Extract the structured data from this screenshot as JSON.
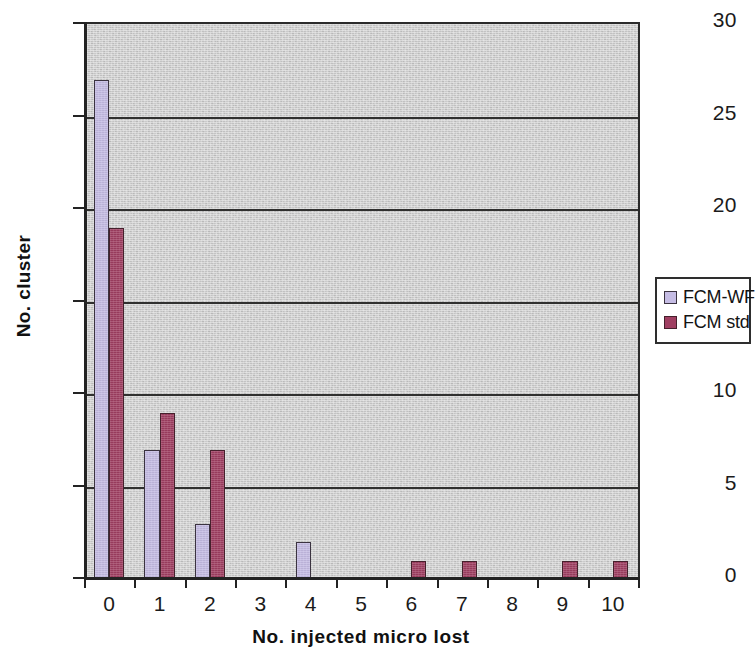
{
  "chart_data": {
    "type": "bar",
    "title": "",
    "subtitle": "",
    "xlabel": "No. injected  micro  lost",
    "ylabel": "No. cluster",
    "categories": [
      "0",
      "1",
      "2",
      "3",
      "4",
      "5",
      "6",
      "7",
      "8",
      "9",
      "10"
    ],
    "series": [
      {
        "name": "FCM-WF",
        "color": "#c5bce4",
        "values": [
          27,
          7,
          3,
          0,
          2,
          0,
          0,
          0,
          0,
          0,
          0
        ]
      },
      {
        "name": "FCM std",
        "color": "#a03f62",
        "values": [
          19,
          9,
          7,
          0,
          0,
          0,
          1,
          1,
          0,
          1,
          1
        ]
      }
    ],
    "ylim": [
      0,
      30
    ],
    "ytick_labels": [
      "0",
      "5",
      "10",
      "15",
      "20",
      "25",
      "30"
    ],
    "ytick_values": [
      0,
      5,
      10,
      15,
      20,
      25,
      30
    ],
    "ystep": 5,
    "grid": "horizontal",
    "gridline_values": [
      5,
      10,
      15,
      20,
      25
    ],
    "legend_position": "right",
    "plot_background_color": "#d2d2d2",
    "page_background_color": "#ffffff",
    "axis_color": "#232323"
  },
  "legend": {
    "entries": [
      {
        "label": "FCM-WF"
      },
      {
        "label": "FCM std"
      }
    ]
  }
}
